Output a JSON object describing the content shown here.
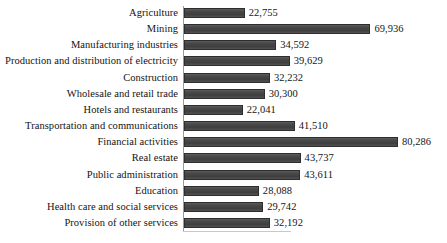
{
  "chart_data": {
    "type": "bar",
    "orientation": "horizontal",
    "title": "",
    "subtitle": "",
    "xlabel": "",
    "ylabel": "",
    "grid": false,
    "legend": false,
    "legend_position": "none",
    "xlim": [
      0,
      80286
    ],
    "axis_max_display": 80286,
    "bar_color": "#4b4b4b",
    "bar_border_color": "#2e2e2e",
    "background_color": "#ffffff",
    "text_color": "#131313",
    "axis_color": "#9a9a9a",
    "value_format": "comma-separated integers",
    "categories": [
      "Agriculture",
      "Mining",
      "Manufacturing industries",
      "Production and distribution of electricity",
      "Construction",
      "Wholesale and retail trade",
      "Hotels and restaurants",
      "Transportation and communications",
      "Financial activities",
      "Real estate",
      "Public administration",
      "Education",
      "Health care and social services",
      "Provision of other services"
    ],
    "values": [
      22755,
      69936,
      34592,
      39629,
      32232,
      30300,
      22041,
      41510,
      80286,
      43737,
      43611,
      28088,
      29742,
      32192
    ],
    "value_labels": [
      "22,755",
      "69,936",
      "34,592",
      "39,629",
      "32,232",
      "30,300",
      "22,041",
      "41,510",
      "80,286",
      "43,737",
      "43,611",
      "28,088",
      "29,742",
      "32,192"
    ]
  }
}
